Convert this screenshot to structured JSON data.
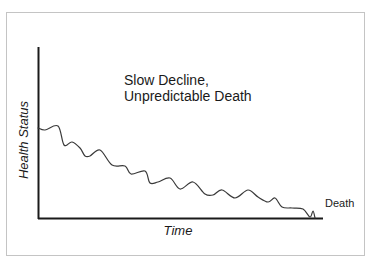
{
  "chart_data": {
    "type": "line",
    "title": "Slow Decline, Unpredictable Death",
    "title_lines": [
      "Slow Decline,",
      "Unpredictable Death"
    ],
    "xlabel": "Time",
    "ylabel": "Health Status",
    "annotations": [
      {
        "text": "Death",
        "position": "end of curve, right of x-axis"
      }
    ],
    "grid": false,
    "legend": null,
    "axes": {
      "x_ticks": [],
      "y_ticks": []
    },
    "series": [
      {
        "name": "Health Status trajectory",
        "description": "Wavy, gradually declining curve from high health to death at baseline",
        "points_px": [
          [
            38,
            128
          ],
          [
            45,
            130
          ],
          [
            58,
            126
          ],
          [
            64,
            145
          ],
          [
            72,
            142
          ],
          [
            80,
            148
          ],
          [
            85,
            156
          ],
          [
            90,
            156
          ],
          [
            100,
            150
          ],
          [
            112,
            165
          ],
          [
            125,
            166
          ],
          [
            131,
            174
          ],
          [
            145,
            171
          ],
          [
            150,
            183
          ],
          [
            158,
            182
          ],
          [
            170,
            178
          ],
          [
            180,
            189
          ],
          [
            193,
            182
          ],
          [
            205,
            194
          ],
          [
            213,
            195
          ],
          [
            222,
            190
          ],
          [
            235,
            198
          ],
          [
            248,
            190
          ],
          [
            258,
            197
          ],
          [
            268,
            202
          ],
          [
            275,
            198
          ],
          [
            282,
            207
          ],
          [
            292,
            208
          ],
          [
            303,
            209
          ],
          [
            310,
            217
          ],
          [
            313,
            211
          ],
          [
            315,
            218
          ]
        ]
      }
    ]
  },
  "labels": {
    "title_line1": "Slow Decline,",
    "title_line2": "Unpredictable Death",
    "y_axis": "Health Status",
    "x_axis": "Time",
    "end_marker": "Death"
  },
  "colors": {
    "axis": "#1a1a1a",
    "curve": "#3a3a3a",
    "frame_border": "#c4c4c4",
    "background": "#ffffff"
  }
}
